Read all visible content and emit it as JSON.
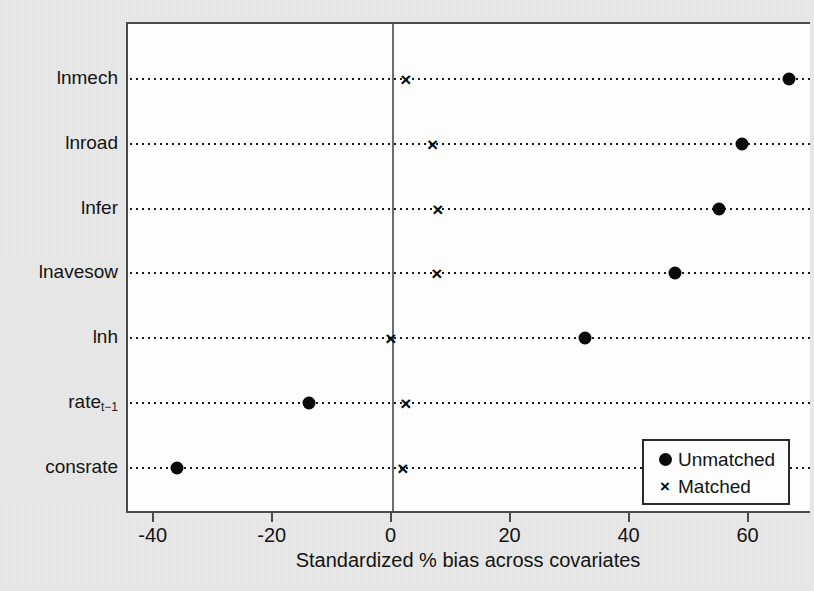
{
  "chart_data": {
    "type": "scatter",
    "title": "",
    "xlabel": "Standardized % bias across covariates",
    "ylabel": "",
    "xlim": [
      -44.5,
      70.5
    ],
    "ylim": [
      0,
      8
    ],
    "grid": "horizontal dotted rows",
    "legend_position": "bottom-right",
    "xticks": [
      -40,
      -20,
      0,
      20,
      40,
      60
    ],
    "xtick_labels": [
      "-40",
      "-20",
      "0",
      "20",
      "40",
      "60"
    ],
    "categories": [
      "lnmech",
      "lnroad",
      "lnfer",
      "lnavesow",
      "lnh",
      "rate",
      "consrate"
    ],
    "category_labels": [
      "lnmech",
      "lnroad",
      "lnfer",
      "lnavesow",
      "lnh",
      "rate",
      "consrate"
    ],
    "category_subscripts": [
      "",
      "",
      "",
      "",
      "",
      "t−1",
      ""
    ],
    "reference_line": 0,
    "series": [
      {
        "name": "Unmatched",
        "marker": "circle",
        "color": "#0a0a0a",
        "values": [
          66.7,
          58.7,
          54.8,
          47.4,
          32.3,
          -14.0,
          -36.3
        ]
      },
      {
        "name": "Matched",
        "marker": "x",
        "color": "#0a0a0a",
        "values": [
          2.2,
          6.7,
          7.6,
          7.4,
          -0.3,
          2.2,
          1.7
        ]
      }
    ]
  },
  "legend": {
    "entries": [
      {
        "label": "Unmatched",
        "symbol": "circle-marker"
      },
      {
        "label": "Matched",
        "symbol": "x-marker"
      }
    ]
  },
  "axis": {
    "x_title": "Standardized % bias across covariates"
  }
}
